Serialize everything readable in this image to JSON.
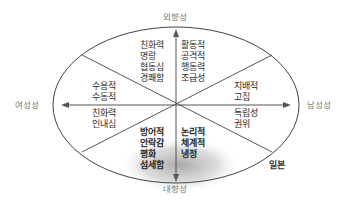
{
  "axes": {
    "top": "외향성",
    "bottom": "내향성",
    "left": "여성성",
    "right": "남성성"
  },
  "quadrants": {
    "top_left_inner": [
      "친화력",
      "명랑",
      "협동심",
      "경쾌함"
    ],
    "top_right_inner": [
      "활동적",
      "공격적",
      "행동력",
      "조급성"
    ],
    "left_upper": [
      "수용적",
      "수동적"
    ],
    "left_lower": [
      "친화력",
      "인내심"
    ],
    "right_upper": [
      "지배적",
      "고집"
    ],
    "right_lower": [
      "독립성",
      "권위"
    ],
    "bottom_left_inner": [
      "방어적",
      "안락감",
      "평화",
      "섬세함"
    ],
    "bottom_right_inner": [
      "논리적",
      "체계적",
      "냉정"
    ]
  },
  "annotation": "일본",
  "colors": {
    "line": "#444444",
    "axis_label": "#777777",
    "shade": "#bdbdbd"
  }
}
